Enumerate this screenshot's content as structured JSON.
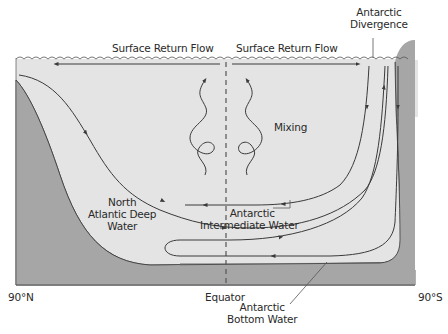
{
  "colors": {
    "water": "#e4e4e4",
    "land": "#a6a6a6",
    "line": "#3a3a3a",
    "text": "#2a2a2a",
    "background": "#ffffff"
  },
  "labels": {
    "surface_return_flow_left": "Surface Return Flow",
    "surface_return_flow_right": "Surface Return Flow",
    "antarctic_divergence_line1": "Antarctic",
    "antarctic_divergence_line2": "Divergence",
    "mixing": "Mixing",
    "nadw_line1": "North",
    "nadw_line2": "Atlantic Deep",
    "nadw_line3": "Water",
    "aaiw_line1": "Antarctic",
    "aaiw_line2": "Intermediate Water",
    "aabw_line1": "Antarctic",
    "aabw_line2": "Bottom Water",
    "axis_left": "90°N",
    "axis_center": "Equator",
    "axis_right": "90°S"
  }
}
